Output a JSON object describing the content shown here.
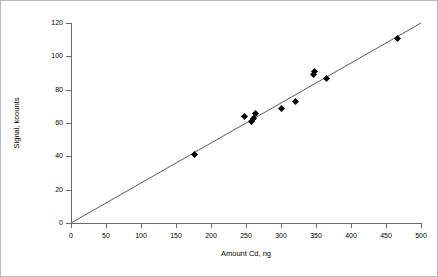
{
  "chart_data": {
    "type": "scatter",
    "title": "",
    "xlabel": "Amount Cd, ng",
    "ylabel": "Signal, kcounts",
    "xlim": [
      0,
      500
    ],
    "ylim": [
      0,
      120
    ],
    "xticks": [
      0,
      50,
      100,
      150,
      200,
      250,
      300,
      350,
      400,
      450,
      500
    ],
    "yticks": [
      0,
      20,
      40,
      60,
      80,
      100,
      120
    ],
    "grid": false,
    "legend": null,
    "marker": "filled-diamond",
    "marker_color": "#000000",
    "line_color": "#595959",
    "points": [
      {
        "x": 177,
        "y": 41
      },
      {
        "x": 248,
        "y": 64
      },
      {
        "x": 258,
        "y": 61
      },
      {
        "x": 260,
        "y": 63
      },
      {
        "x": 263,
        "y": 66
      },
      {
        "x": 300,
        "y": 69
      },
      {
        "x": 320,
        "y": 73
      },
      {
        "x": 347,
        "y": 89
      },
      {
        "x": 348,
        "y": 91
      },
      {
        "x": 365,
        "y": 87
      },
      {
        "x": 467,
        "y": 111
      }
    ],
    "trendline": {
      "type": "linear",
      "slope": 0.24,
      "intercept": 0,
      "x_start": 0,
      "y_start": 0,
      "x_end": 500,
      "y_end": 120
    }
  }
}
